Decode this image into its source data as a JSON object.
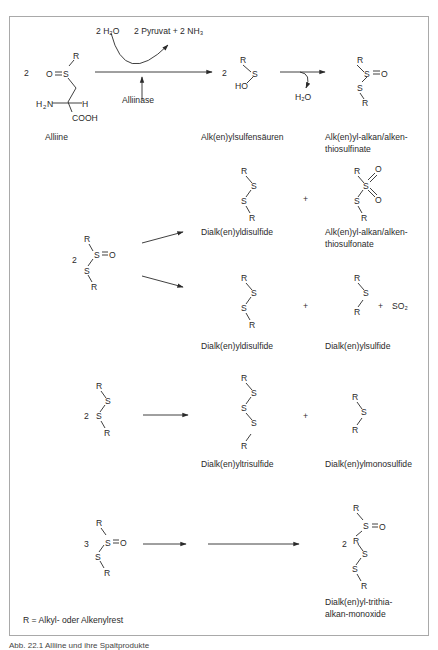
{
  "figure": {
    "legend_note": "R = Alkyl- oder Alkenylrest",
    "caption": "Abb. 22.1 Alliine und ihre Spaltprodukte"
  },
  "row1": {
    "coefficient": "2",
    "reagents_in": "2 H₂O",
    "reagents_out": "2 Pyruvat + 2  NH₃",
    "enzyme": "Alliinase",
    "byproduct": "H₂O",
    "product1_coefficient": "2",
    "labels": {
      "alliine": "Alliine",
      "sulfenic_acids": "Alk(en)ylsulfensäuren",
      "thiosulfinates_l1": "Alk(en)yl-alkan/alken-",
      "thiosulfinates_l2": "thiosulfinate"
    }
  },
  "row2": {
    "coefficient": "2",
    "plus": "+",
    "labels": {
      "disulfide_a": "Dialk(en)yldisulfide",
      "thiosulfonate_l1": "Alk(en)yl-alkan/alken-",
      "thiosulfonate_l2": "thiosulfonate",
      "disulfide_b": "Dialk(en)yldisulfide",
      "monosulfide_b": "Dialk(en)ylsulfide",
      "so2": "SO₂"
    }
  },
  "row3": {
    "coefficient": "2",
    "plus": "+",
    "labels": {
      "trisulfide": "Dialk(en)yltrisulfide",
      "monosulfide": "Dialk(en)ylmonosulfide"
    }
  },
  "row4": {
    "coefficient": "3",
    "product_coefficient": "2",
    "labels": {
      "product_l1": "Dialk(en)yl-trithia-",
      "product_l2": "alkan-monoxide"
    }
  }
}
